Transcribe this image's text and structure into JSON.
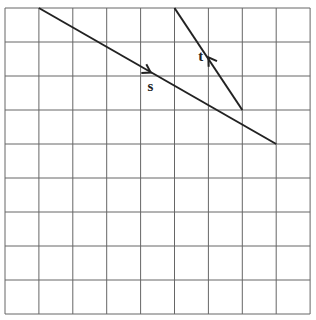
{
  "diagram": {
    "type": "grid-with-vectors",
    "grid": {
      "columns": 9,
      "rows": 9,
      "origin_px": [
        5,
        8
      ],
      "cell_w": 33.9,
      "cell_h": 34,
      "line_color": "#666666",
      "background": "#ffffff"
    },
    "vectors": [
      {
        "id": "s",
        "label": "s",
        "start": [
          1,
          0
        ],
        "end": [
          8,
          4
        ],
        "arrow_at": [
          4.3,
          1.9
        ],
        "direction": "down-right",
        "label_pos": [
          4.2,
          2.45
        ],
        "color": "#222222"
      },
      {
        "id": "t",
        "label": "t",
        "start": [
          5,
          0
        ],
        "end": [
          7,
          3
        ],
        "arrow_at": [
          6,
          1.45
        ],
        "direction": "up-left",
        "label_pos": [
          5.7,
          1.55
        ],
        "color": "#222222"
      }
    ]
  }
}
